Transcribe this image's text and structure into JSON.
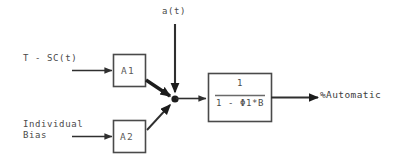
{
  "diagram": {
    "colors": {
      "stroke": "#3b3b3b",
      "thick_stroke": "#202020",
      "box_stroke": "#4a4a4a",
      "text": "#4a4a4a",
      "background": "#ffffff"
    },
    "inputs": [
      {
        "name": "input-top",
        "label": "T - SC(t)"
      },
      {
        "name": "input-bottom",
        "label": "Individual\nBias"
      },
      {
        "name": "disturbance",
        "label": "a(t)"
      }
    ],
    "blocks": [
      {
        "name": "gain-a1",
        "label": "A1"
      },
      {
        "name": "gain-a2",
        "label": "A2"
      },
      {
        "name": "transfer-function",
        "numerator": "1",
        "denominator": "1 - Φ1*B"
      }
    ],
    "output": {
      "name": "output",
      "label": "%Automatic"
    },
    "junction": {
      "name": "summing-junction",
      "label": ""
    }
  }
}
